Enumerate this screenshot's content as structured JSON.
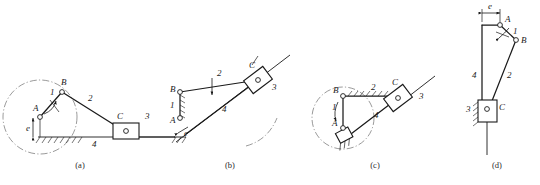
{
  "figure": {
    "panels": [
      {
        "id": "a",
        "caption": "(a)",
        "joints": [
          {
            "name": "A",
            "label": "A"
          },
          {
            "name": "B",
            "label": "B"
          },
          {
            "name": "C",
            "label": "C"
          }
        ],
        "links": [
          {
            "name": "crank",
            "label": "1"
          },
          {
            "name": "coupler",
            "label": "2"
          },
          {
            "name": "slider",
            "label": "3"
          },
          {
            "name": "frame",
            "label": "4"
          }
        ],
        "dimension": {
          "label": "e"
        },
        "features": [
          "dash-dot crank circle",
          "horizontal ground hatching",
          "slider block on horizontal guide"
        ]
      },
      {
        "id": "b",
        "caption": "(b)",
        "joints": [
          {
            "name": "A",
            "label": "A"
          },
          {
            "name": "B",
            "label": "B"
          },
          {
            "name": "C",
            "label": "C"
          }
        ],
        "links": [
          {
            "name": "crank",
            "label": "1"
          },
          {
            "name": "coupler",
            "label": "2"
          },
          {
            "name": "slider",
            "label": "3"
          },
          {
            "name": "frame",
            "label": "4"
          }
        ],
        "dimension": {
          "label": "e"
        },
        "features": [
          "inclined guide",
          "rotated slider block",
          "dash-dot arc",
          "vertical hatched crank"
        ]
      },
      {
        "id": "c",
        "caption": "(c)",
        "joints": [
          {
            "name": "A",
            "label": "A"
          },
          {
            "name": "B",
            "label": "B"
          },
          {
            "name": "C",
            "label": "C"
          }
        ],
        "links": [
          {
            "name": "crank",
            "label": "1"
          },
          {
            "name": "coupler",
            "label": "2"
          },
          {
            "name": "slider",
            "label": "3"
          },
          {
            "name": "frame",
            "label": "4"
          }
        ],
        "features": [
          "dash-dot crank circle",
          "horizontal hatched coupler",
          "inclined guide",
          "rotation arrow"
        ]
      },
      {
        "id": "d",
        "caption": "(d)",
        "joints": [
          {
            "name": "A",
            "label": "A"
          },
          {
            "name": "B",
            "label": "B"
          },
          {
            "name": "C",
            "label": "C"
          }
        ],
        "links": [
          {
            "name": "crank",
            "label": "1"
          },
          {
            "name": "coupler",
            "label": "2"
          },
          {
            "name": "slider",
            "label": "3"
          },
          {
            "name": "frame",
            "label": "4"
          }
        ],
        "dimension": {
          "label": "e"
        },
        "features": [
          "vertical frame",
          "eccentricity dimension e at top",
          "hatched vertical slider guide"
        ]
      }
    ]
  }
}
